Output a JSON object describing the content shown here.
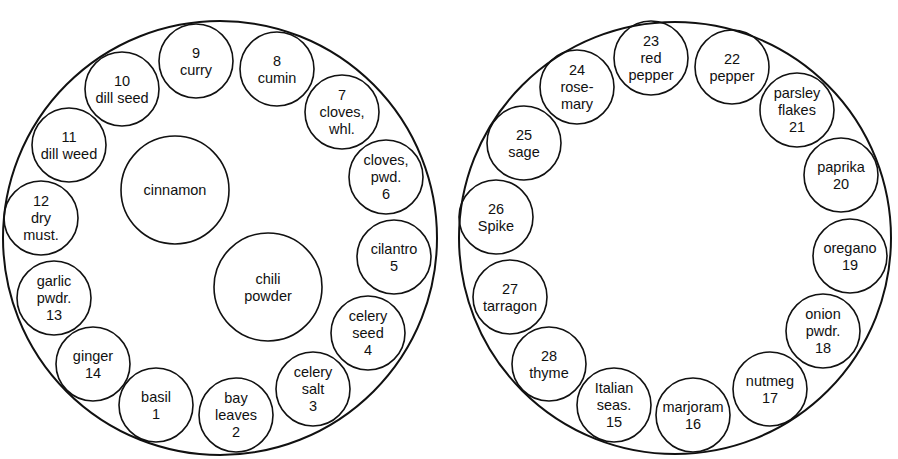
{
  "diagram": {
    "colors": {
      "stroke": "#111111",
      "background": "#ffffff"
    },
    "left_carousel": {
      "center": [
        220,
        238
      ],
      "r": 217,
      "center_jars": [
        {
          "name": "cinnamon",
          "lines": [
            "cinnamon"
          ],
          "cx": 175,
          "cy": 190,
          "r": 54
        },
        {
          "name": "chili powder",
          "lines": [
            "chili",
            "powder"
          ],
          "cx": 268,
          "cy": 287,
          "r": 54
        }
      ],
      "jars": [
        {
          "num": 1,
          "name": "basil",
          "lines": [
            "basil",
            "1"
          ],
          "cx": 156,
          "cy": 405,
          "r": 37
        },
        {
          "num": 2,
          "name": "bay leaves",
          "lines": [
            "bay",
            "leaves",
            "2"
          ],
          "cx": 236,
          "cy": 415,
          "r": 37
        },
        {
          "num": 3,
          "name": "celery salt",
          "lines": [
            "celery",
            "salt",
            "3"
          ],
          "cx": 313,
          "cy": 389,
          "r": 37
        },
        {
          "num": 4,
          "name": "celery seed",
          "lines": [
            "celery",
            "seed",
            "4"
          ],
          "cx": 368,
          "cy": 333,
          "r": 37
        },
        {
          "num": 5,
          "name": "cilantro",
          "lines": [
            "cilantro",
            "5"
          ],
          "cx": 394,
          "cy": 257,
          "r": 37
        },
        {
          "num": 6,
          "name": "cloves, pwd.",
          "lines": [
            "cloves,",
            "pwd.",
            "6"
          ],
          "cx": 386,
          "cy": 177,
          "r": 37
        },
        {
          "num": 7,
          "name": "cloves, whl.",
          "lines": [
            "7",
            "cloves,",
            "whl."
          ],
          "cx": 342,
          "cy": 112,
          "r": 37
        },
        {
          "num": 8,
          "name": "cumin",
          "lines": [
            "8",
            "cumin"
          ],
          "cx": 277,
          "cy": 69,
          "r": 37
        },
        {
          "num": 9,
          "name": "curry",
          "lines": [
            "9",
            "curry"
          ],
          "cx": 196,
          "cy": 61,
          "r": 37
        },
        {
          "num": 10,
          "name": "dill seed",
          "lines": [
            "10",
            "dill seed"
          ],
          "cx": 122,
          "cy": 89,
          "r": 37
        },
        {
          "num": 11,
          "name": "dill weed",
          "lines": [
            "11",
            "dill weed"
          ],
          "cx": 69,
          "cy": 145,
          "r": 37
        },
        {
          "num": 12,
          "name": "dry must.",
          "lines": [
            "12",
            "dry",
            "must."
          ],
          "cx": 41,
          "cy": 218,
          "r": 37
        },
        {
          "num": 13,
          "name": "garlic pwdr.",
          "lines": [
            "garlic",
            "pwdr.",
            "13"
          ],
          "cx": 54,
          "cy": 298,
          "r": 37
        },
        {
          "num": 14,
          "name": "ginger",
          "lines": [
            "ginger",
            "14"
          ],
          "cx": 93,
          "cy": 364,
          "r": 37
        }
      ]
    },
    "right_carousel": {
      "center": [
        675,
        238
      ],
      "r": 216,
      "jars": [
        {
          "num": 15,
          "name": "Italian seas.",
          "lines": [
            "Italian",
            "seas.",
            "15"
          ],
          "cx": 614,
          "cy": 405,
          "r": 37
        },
        {
          "num": 16,
          "name": "marjoram",
          "lines": [
            "marjoram",
            "16"
          ],
          "cx": 693,
          "cy": 415,
          "r": 37
        },
        {
          "num": 17,
          "name": "nutmeg",
          "lines": [
            "nutmeg",
            "17"
          ],
          "cx": 770,
          "cy": 389,
          "r": 37
        },
        {
          "num": 18,
          "name": "onion pwdr.",
          "lines": [
            "onion",
            "pwdr.",
            "18"
          ],
          "cx": 823,
          "cy": 331,
          "r": 37
        },
        {
          "num": 19,
          "name": "oregano",
          "lines": [
            "oregano",
            "19"
          ],
          "cx": 850,
          "cy": 256,
          "r": 37
        },
        {
          "num": 20,
          "name": "paprika",
          "lines": [
            "paprika",
            "20"
          ],
          "cx": 841,
          "cy": 175,
          "r": 37
        },
        {
          "num": 21,
          "name": "parsley flakes",
          "lines": [
            "parsley",
            "flakes",
            "21"
          ],
          "cx": 797,
          "cy": 110,
          "r": 37
        },
        {
          "num": 22,
          "name": "pepper",
          "lines": [
            "22",
            "pepper"
          ],
          "cx": 732,
          "cy": 67,
          "r": 37
        },
        {
          "num": 23,
          "name": "red pepper",
          "lines": [
            "23",
            "red",
            "pepper"
          ],
          "cx": 651,
          "cy": 58,
          "r": 37
        },
        {
          "num": 24,
          "name": "rosemary",
          "lines": [
            "24",
            "rose-",
            "mary"
          ],
          "cx": 577,
          "cy": 87,
          "r": 37
        },
        {
          "num": 25,
          "name": "sage",
          "lines": [
            "25",
            "sage"
          ],
          "cx": 524,
          "cy": 143,
          "r": 37
        },
        {
          "num": 26,
          "name": "Spike",
          "lines": [
            "26",
            "Spike"
          ],
          "cx": 496,
          "cy": 217,
          "r": 37
        },
        {
          "num": 27,
          "name": "tarragon",
          "lines": [
            "27",
            "tarragon"
          ],
          "cx": 510,
          "cy": 297,
          "r": 37
        },
        {
          "num": 28,
          "name": "thyme",
          "lines": [
            "28",
            "thyme"
          ],
          "cx": 549,
          "cy": 364,
          "r": 37
        }
      ]
    }
  }
}
